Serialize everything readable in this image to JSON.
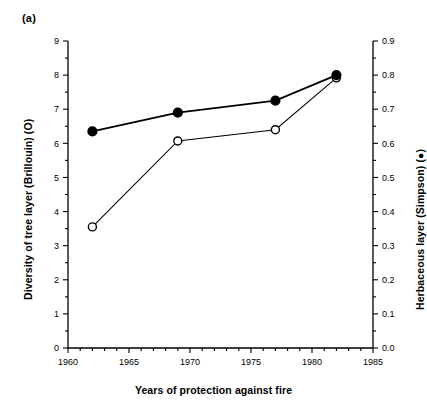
{
  "figure": {
    "panel_label": "(a)",
    "xlabel": "Years of protection against fire",
    "ylabel_left": "Diversity of tree layer (Brillouin) (O)",
    "ylabel_right": "Herbaceous layer (Simpson) (●)",
    "background_color": "#ffffff",
    "line_color": "#000000"
  },
  "chart_data": {
    "type": "line",
    "title": "(a)",
    "xlabel": "Years of protection against fire",
    "ylabel": "Diversity of tree layer (Brillouin) (O)",
    "ylabel_right": "Herbaceous layer (Simpson) (●)",
    "xlim": [
      1960,
      1985
    ],
    "ylim": [
      0,
      9
    ],
    "ylim_right": [
      0.0,
      0.9
    ],
    "x_major_ticks": [
      1960,
      1965,
      1970,
      1975,
      1980,
      1985
    ],
    "x_minor_tick_interval": 1,
    "y_left_ticks": [
      0,
      1,
      2,
      3,
      4,
      5,
      6,
      7,
      8,
      9
    ],
    "y_left_minor_tick_interval": 0.5,
    "y_right_ticks": [
      "0.0",
      "0.1",
      "0.2",
      "0.3",
      "0.4",
      "0.5",
      "0.6",
      "0.7",
      "0.8",
      "0.9"
    ],
    "y_right_minor_tick_interval": 0.05,
    "grid": false,
    "legend": "none",
    "x": [
      1962,
      1969,
      1977,
      1982
    ],
    "series": [
      {
        "name": "Diversity of tree layer (Brillouin)",
        "marker": "open-circle",
        "axis": "left",
        "values": [
          3.55,
          6.07,
          6.4,
          7.92
        ]
      },
      {
        "name": "Herbaceous layer (Simpson)",
        "marker": "filled-circle",
        "axis": "right",
        "values": [
          0.635,
          0.69,
          0.725,
          0.8
        ]
      }
    ]
  }
}
